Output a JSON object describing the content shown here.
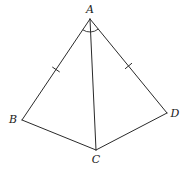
{
  "figure": {
    "type": "geometry-diagram",
    "stroke_color": "#2a2a2a",
    "background": "#ffffff"
  },
  "points": {
    "A": {
      "label": "A",
      "x": 90,
      "y": 19,
      "label_x": 90,
      "label_y": 13
    },
    "B": {
      "label": "B",
      "x": 22,
      "y": 120,
      "label_x": 13,
      "label_y": 123
    },
    "C": {
      "label": "C",
      "x": 96,
      "y": 150,
      "label_x": 96,
      "label_y": 163
    },
    "D": {
      "label": "D",
      "x": 167,
      "y": 113,
      "label_x": 175,
      "label_y": 117
    }
  },
  "segments": [
    {
      "name": "AB",
      "from": "A",
      "to": "B",
      "tick_marks": 1
    },
    {
      "name": "AD",
      "from": "A",
      "to": "D",
      "tick_marks": 1
    },
    {
      "name": "AC",
      "from": "A",
      "to": "C",
      "tick_marks": 0
    },
    {
      "name": "BC",
      "from": "B",
      "to": "C",
      "tick_marks": 0
    },
    {
      "name": "CD",
      "from": "C",
      "to": "D",
      "tick_marks": 0
    }
  ],
  "markings": {
    "equal_sides": [
      "AB",
      "AD"
    ],
    "angle_arc": {
      "vertex": "A",
      "between": [
        "AB",
        "AD"
      ],
      "radius": 13
    }
  }
}
